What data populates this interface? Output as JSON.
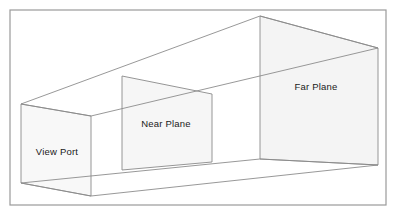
{
  "figure": {
    "kind": "3d-view-frustum-diagram",
    "canvas": {
      "width": 397,
      "height": 217
    },
    "background_color": "#ffffff"
  },
  "frame": {
    "name": "diagram-border",
    "x": 10,
    "y": 10,
    "width": 376,
    "height": 195,
    "stroke_color": "#9a9a9a",
    "stroke_width": 1.2,
    "fill": "none"
  },
  "style": {
    "line_color": "#8c8c8c",
    "line_width": 0.9,
    "plane_fill": "#f7f7f7",
    "plane_fill_far": "#f4f4f4",
    "plane_stroke": "#8a8a8a",
    "label_color": "#1a1a1a",
    "label_font_size": 9.5
  },
  "planes": [
    {
      "id": "view-port",
      "label": "View Port",
      "label_x": 57,
      "label_y": 152,
      "fill": "#f8f8f8",
      "points": "21,104 21,183 91,196 91,116",
      "corners": {
        "top_left": [
          21,
          104
        ],
        "bottom_left": [
          21,
          183
        ],
        "bottom_right": [
          91,
          196
        ],
        "top_right": [
          91,
          116
        ]
      }
    },
    {
      "id": "near-plane",
      "label": "Near Plane",
      "label_x": 166,
      "label_y": 124,
      "fill": "#f6f6f6",
      "points": "122,76 122,170 212,162 212,94",
      "corners": {
        "top_left": [
          122,
          76
        ],
        "bottom_left": [
          122,
          170
        ],
        "bottom_right": [
          212,
          162
        ],
        "top_right": [
          212,
          94
        ]
      }
    },
    {
      "id": "far-plane",
      "label": "Far Plane",
      "label_x": 316,
      "label_y": 87,
      "fill": "#f4f4f4",
      "points": "260,16 260,159 378,165 378,48",
      "corners": {
        "top_left": [
          260,
          16
        ],
        "bottom_left": [
          260,
          159
        ],
        "bottom_right": [
          378,
          165
        ],
        "top_right": [
          378,
          48
        ]
      }
    }
  ],
  "edges": [
    {
      "id": "top-left-rail",
      "x1": 21,
      "y1": 104,
      "x2": 260,
      "y2": 16
    },
    {
      "id": "top-right-rail",
      "x1": 91,
      "y1": 116,
      "x2": 378,
      "y2": 48
    },
    {
      "id": "bottom-left-rail",
      "x1": 21,
      "y1": 183,
      "x2": 260,
      "y2": 159
    },
    {
      "id": "bottom-right-rail",
      "x1": 91,
      "y1": 196,
      "x2": 378,
      "y2": 165
    },
    {
      "id": "viewport-top-depth",
      "x1": 21,
      "y1": 104,
      "x2": 91,
      "y2": 116
    },
    {
      "id": "viewport-bottom-depth",
      "x1": 21,
      "y1": 183,
      "x2": 91,
      "y2": 196
    },
    {
      "id": "far-top-depth",
      "x1": 260,
      "y1": 16,
      "x2": 378,
      "y2": 48
    },
    {
      "id": "far-bottom-depth",
      "x1": 260,
      "y1": 159,
      "x2": 378,
      "y2": 165
    }
  ],
  "labels": [
    {
      "id": "view-port-label",
      "text": "View Port",
      "x": 57,
      "y": 152
    },
    {
      "id": "near-plane-label",
      "text": "Near Plane",
      "x": 166,
      "y": 124
    },
    {
      "id": "far-plane-label",
      "text": "Far Plane",
      "x": 316,
      "y": 87
    }
  ]
}
